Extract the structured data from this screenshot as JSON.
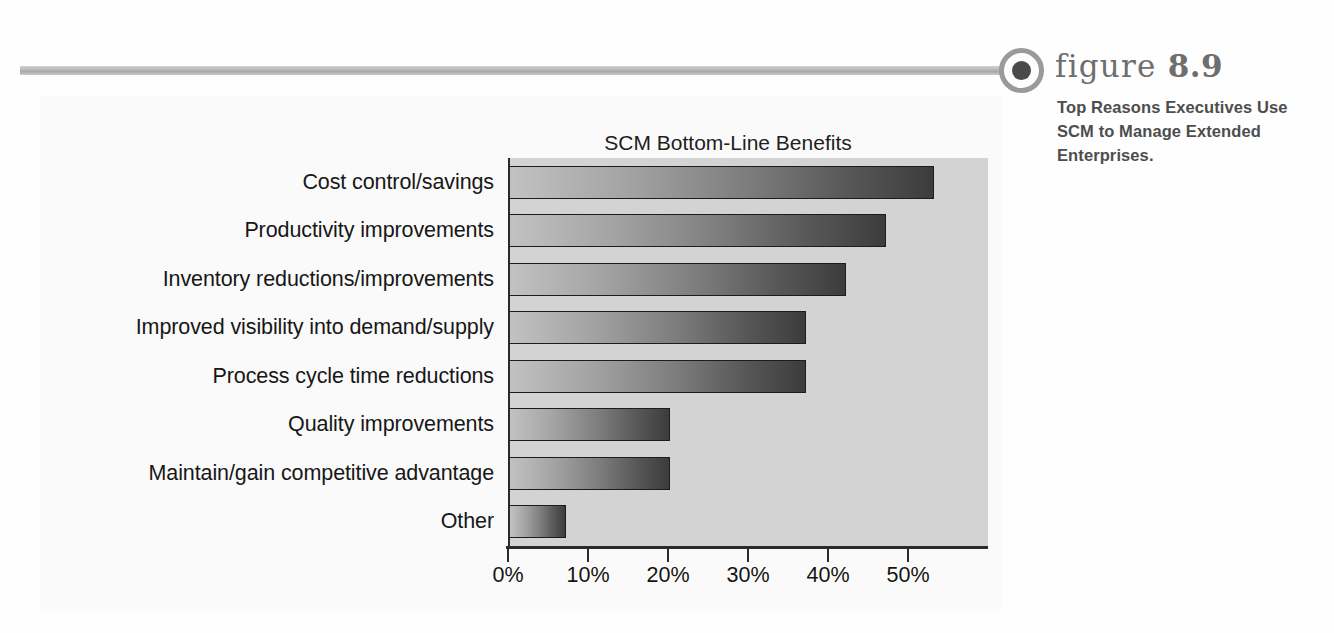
{
  "figure": {
    "label_word": "figure",
    "number": "8.9",
    "caption": "Top Reasons Executives Use SCM to Manage Extended Enterprises.",
    "bullet_icon": "filled-circle-icon",
    "rule_icon": "horizontal-rule-decoration"
  },
  "chart_data": {
    "type": "bar",
    "orientation": "horizontal",
    "title": "SCM Bottom-Line Benefits",
    "xlabel": "",
    "ylabel": "",
    "xlim": [
      0,
      60
    ],
    "grid": false,
    "legend": null,
    "categories": [
      "Cost control/savings",
      "Productivity improvements",
      "Inventory reductions/improvements",
      "Improved visibility into demand/supply",
      "Process cycle time reductions",
      "Quality improvements",
      "Maintain/gain competitive advantage",
      "Other"
    ],
    "values": [
      53,
      47,
      42,
      37,
      37,
      20,
      20,
      7
    ],
    "value_unit": "%",
    "xticks": [
      0,
      10,
      20,
      30,
      40,
      50
    ],
    "xtick_labels": [
      "0%",
      "10%",
      "20%",
      "30%",
      "40%",
      "50%"
    ],
    "colors": {
      "plot_background": "#d3d3d3",
      "bar_gradient_start": "#c2c2c2",
      "bar_gradient_end": "#3c3c3c",
      "bar_outline": "#1c1c1c",
      "axis": "#2a2a2a",
      "panel_background": "#fafafa",
      "caption_text": "#4d4d4d",
      "rule": "#b3b3b3"
    }
  }
}
